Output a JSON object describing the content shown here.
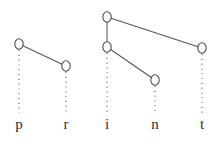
{
  "figure": {
    "title": "print",
    "background_color": "#ffffff",
    "node_stroke_color": "#4a4a4a",
    "node_fill_color": "#ffffff",
    "line_color": "#555555",
    "dotted_line_color": "#6b6b6b",
    "label_color": "#2e2e2e",
    "width": 215,
    "height": 144
  },
  "chart_data": {
    "type": "diagram",
    "title": "print",
    "xlabel": "",
    "ylabel": "",
    "segment_tier": {
      "labels": [
        "p",
        "r",
        "i",
        "n",
        "t"
      ],
      "x": [
        19,
        66,
        107,
        155,
        202
      ],
      "y": 128
    },
    "nodes": [
      {
        "id": "n1",
        "label": "p-high",
        "segment": "p",
        "x": 19,
        "y": 44,
        "group": 1
      },
      {
        "id": "n2",
        "label": "r-low",
        "segment": "r",
        "x": 66,
        "y": 66,
        "group": 1
      },
      {
        "id": "n3",
        "label": "i-top",
        "segment": "i",
        "x": 107,
        "y": 17,
        "group": 2
      },
      {
        "id": "n4",
        "label": "i-mid",
        "segment": "i",
        "x": 107,
        "y": 47,
        "group": 2
      },
      {
        "id": "n5",
        "label": "n-low",
        "segment": "n",
        "x": 155,
        "y": 80,
        "group": 2
      },
      {
        "id": "n6",
        "label": "t-mid",
        "segment": "t",
        "x": 202,
        "y": 48,
        "group": 2
      }
    ],
    "node_radius_x": 4.2,
    "node_radius_y": 5.2,
    "association_lines": [
      {
        "from": "n1",
        "to": "n2"
      },
      {
        "from": "n3",
        "to": "n4"
      },
      {
        "from": "n3",
        "to": "n6"
      },
      {
        "from": "n4",
        "to": "n5"
      }
    ],
    "dotted_links": [
      {
        "node": "n1",
        "segment": "p",
        "x": 19,
        "y_start": 50,
        "y_end": 113
      },
      {
        "node": "n2",
        "segment": "r",
        "x": 66,
        "y_start": 72,
        "y_end": 113
      },
      {
        "node": "n4",
        "segment": "i",
        "x": 107,
        "y_start": 53,
        "y_end": 113
      },
      {
        "node": "n5",
        "segment": "n",
        "x": 155,
        "y_start": 86,
        "y_end": 113
      },
      {
        "node": "n6",
        "segment": "t",
        "x": 202,
        "y_start": 54,
        "y_end": 113
      }
    ]
  }
}
